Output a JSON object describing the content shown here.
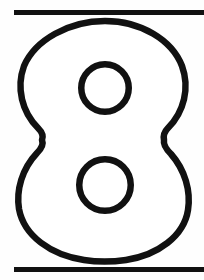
{
  "page": {
    "width": 204,
    "height": 280,
    "background_color": "#fefefe",
    "ink_color": "#111111",
    "caption": "8"
  },
  "figure": {
    "name": "numeral-eight-outline",
    "character": "8",
    "style": "outline",
    "stroke_color": "#111111",
    "fill_color": "#ffffff",
    "stroke_width_px": 6
  },
  "rules": [
    {
      "name": "top-rule",
      "label": "top horizontal rule",
      "x": 14,
      "y": 10,
      "width": 190,
      "height": 5,
      "color": "#111111"
    },
    {
      "name": "bottom-rule",
      "label": "bottom horizontal rule",
      "x": 14,
      "y": 267,
      "width": 190,
      "height": 5,
      "color": "#111111"
    }
  ],
  "glyph_geometry": {
    "bounds": {
      "left": 18,
      "top": 21,
      "right": 191,
      "bottom": 261
    },
    "upper_bowl": {
      "left": 21,
      "right": 186,
      "top": 21,
      "bottom": 140
    },
    "lower_bowl": {
      "left": 18,
      "right": 191,
      "top": 140,
      "bottom": 261
    },
    "waist_y": 140,
    "waist_left_x": 42,
    "waist_right_x": 164,
    "upper_counter": {
      "cx": 105,
      "cy": 88,
      "rx": 27,
      "ry": 27
    },
    "lower_counter": {
      "cx": 105,
      "cy": 185,
      "rx": 29,
      "ry": 29
    }
  }
}
